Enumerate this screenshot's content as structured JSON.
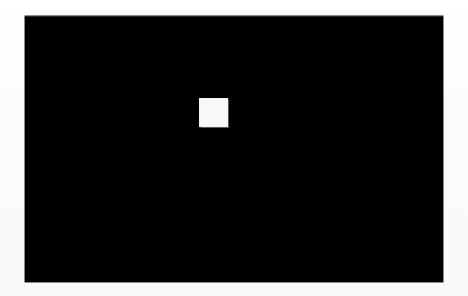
{
  "canvas": {
    "width": 468,
    "height": 296,
    "background_color": "#fdfdfd",
    "description": "Blank light page background surrounding a black display panel"
  },
  "display_panel": {
    "name": "black-screen-region",
    "x": 25,
    "y": 16,
    "width": 418,
    "height": 266,
    "fill_color": "#000000",
    "border_color": "#1a1a1a"
  },
  "marker": {
    "name": "white-square-marker",
    "shape": "square",
    "x": 199,
    "y": 98,
    "width": 29,
    "height": 29,
    "fill_color": "#f8f8f8",
    "relative_x": 174,
    "relative_y": 82
  },
  "labels": {
    "screen_alt": "",
    "marker_alt": ""
  }
}
